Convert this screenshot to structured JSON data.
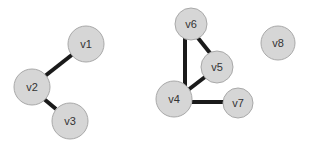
{
  "diagram": {
    "type": "undirected-graph",
    "colors": {
      "node_fill": "#d6d6d6",
      "node_stroke": "#a9a9a9",
      "edge": "#1a1a1a",
      "label": "#333333",
      "background": "#ffffff"
    },
    "nodes": [
      {
        "id": "v1",
        "label": "v1",
        "cx": 86,
        "cy": 44,
        "r": 18
      },
      {
        "id": "v2",
        "label": "v2",
        "cx": 32,
        "cy": 87,
        "r": 18
      },
      {
        "id": "v3",
        "label": "v3",
        "cx": 70,
        "cy": 121,
        "r": 18
      },
      {
        "id": "v6",
        "label": "v6",
        "cx": 191,
        "cy": 24,
        "r": 16
      },
      {
        "id": "v5",
        "label": "v5",
        "cx": 217,
        "cy": 67,
        "r": 16
      },
      {
        "id": "v4",
        "label": "v4",
        "cx": 174,
        "cy": 99,
        "r": 18
      },
      {
        "id": "v7",
        "label": "v7",
        "cx": 238,
        "cy": 103,
        "r": 15
      },
      {
        "id": "v8",
        "label": "v8",
        "cx": 278,
        "cy": 43,
        "r": 17
      }
    ],
    "edges": [
      {
        "from": "v1",
        "to": "v2",
        "x1": 73,
        "y1": 54,
        "x2": 45,
        "y2": 76
      },
      {
        "from": "v2",
        "to": "v3",
        "x1": 44,
        "y1": 99,
        "x2": 56,
        "y2": 109
      },
      {
        "from": "v6",
        "to": "v4",
        "x1": 185,
        "y1": 38,
        "x2": 185,
        "y2": 86
      },
      {
        "from": "v6",
        "to": "v5",
        "x1": 198,
        "y1": 38,
        "x2": 210,
        "y2": 53
      },
      {
        "from": "v5",
        "to": "v4",
        "x1": 205,
        "y1": 77,
        "x2": 188,
        "y2": 90
      },
      {
        "from": "v4",
        "to": "v7",
        "x1": 192,
        "y1": 102,
        "x2": 223,
        "y2": 102
      }
    ]
  }
}
